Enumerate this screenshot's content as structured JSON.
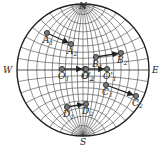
{
  "diagram": {
    "type": "stereographic-net",
    "directions": {
      "north": "N",
      "south": "S",
      "west": "W",
      "east": "E"
    },
    "center": [
      83,
      70
    ],
    "radius": 66,
    "point_pairs": [
      {
        "name": "A",
        "from": {
          "label": "A",
          "sub": "1",
          "pos": [
            47,
            33
          ]
        },
        "to": {
          "label": "A",
          "sub": "2",
          "pos": [
            71,
            44
          ]
        }
      },
      {
        "name": "B",
        "from": {
          "label": "B",
          "sub": "1",
          "pos": [
            96,
            57
          ]
        },
        "to": {
          "label": "B",
          "sub": "2",
          "pos": [
            121,
            53
          ]
        }
      },
      {
        "name": "O1",
        "from": {
          "label": "O",
          "sub": "1",
          "pos": [
            62,
            69
          ]
        },
        "to": {
          "label": "O'",
          "sub": "2",
          "pos": [
            85,
            69
          ]
        }
      },
      {
        "name": "O2",
        "from": {
          "label": "O",
          "sub": "2",
          "pos": [
            86,
            69
          ]
        },
        "to": {
          "label": "O'",
          "sub": "1",
          "pos": [
            107,
            69
          ]
        }
      },
      {
        "name": "C",
        "from": {
          "label": "C",
          "sub": "1",
          "pos": [
            106,
            85
          ]
        },
        "to": {
          "label": "C",
          "sub": "2",
          "pos": [
            136,
            96
          ]
        }
      },
      {
        "name": "D",
        "from": {
          "label": "D",
          "sub": "1",
          "pos": [
            67,
            107
          ]
        },
        "to": {
          "label": "D",
          "sub": "2",
          "pos": [
            86,
            104
          ]
        }
      }
    ],
    "colors": {
      "line": "#222222",
      "grid": "#333333",
      "point_fill": "#777777"
    }
  }
}
